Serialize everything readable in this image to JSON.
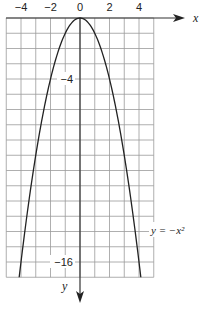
{
  "chart_data": {
    "type": "line",
    "title": "",
    "xlabel": "x",
    "ylabel": "y",
    "xlim": [
      -5,
      5
    ],
    "ylim": [
      -17,
      0
    ],
    "grid": true,
    "y_axis_direction": "down (negative y downward, arrow points down)",
    "x_ticks": [
      {
        "value": -4,
        "label": "−4"
      },
      {
        "value": -2,
        "label": "−2"
      },
      {
        "value": 0,
        "label": "0"
      },
      {
        "value": 2,
        "label": "2"
      },
      {
        "value": 4,
        "label": "4"
      }
    ],
    "y_ticks": [
      {
        "value": -4,
        "label": "−4"
      },
      {
        "value": -16,
        "label": "−16"
      }
    ],
    "series": [
      {
        "name": "y = −x²",
        "equation": "y = -x^2",
        "x": [
          -4.12,
          -4,
          -3.5,
          -3,
          -2.5,
          -2,
          -1.5,
          -1,
          -0.5,
          0,
          0.5,
          1,
          1.5,
          2,
          2.5,
          3,
          3.5,
          4,
          4.12
        ],
        "y": [
          -17,
          -16,
          -12.25,
          -9,
          -6.25,
          -4,
          -2.25,
          -1,
          -0.25,
          0,
          -0.25,
          -1,
          -2.25,
          -4,
          -6.25,
          -9,
          -12.25,
          -16,
          -17
        ]
      }
    ],
    "annotations": [
      {
        "text": "y = −x²",
        "near": [
          5,
          -14
        ]
      }
    ]
  },
  "labels": {
    "x_axis": "x",
    "y_axis": "y",
    "curve": "y = −x²"
  },
  "colors": {
    "curve": "#222222",
    "grid": "#9a9a9a",
    "axis": "#333333"
  }
}
